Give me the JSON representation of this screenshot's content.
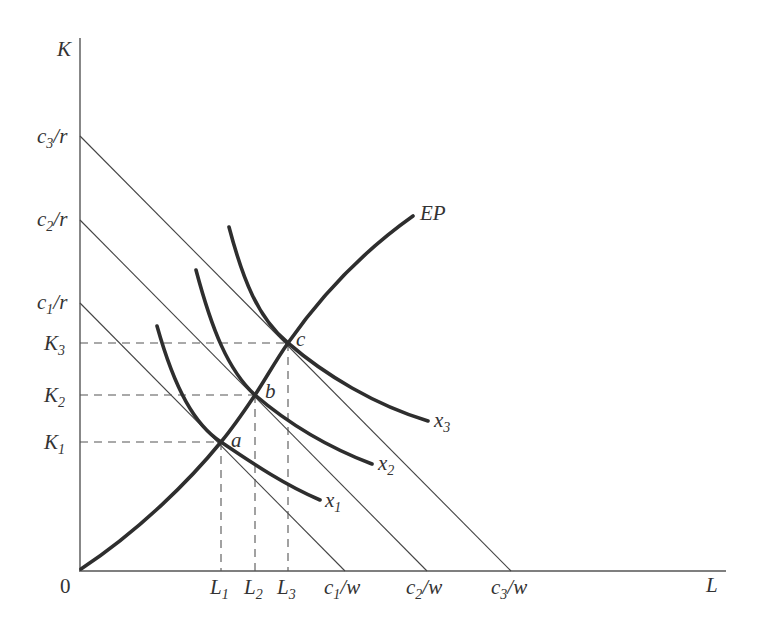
{
  "diagram": {
    "type": "isoquant-isocost-expansion-path",
    "axes": {
      "y_label": "K",
      "x_label": "L",
      "origin_label": "0"
    },
    "y_intercepts": [
      {
        "id": "c3r",
        "base": "c",
        "sub": "3",
        "tail": "/r"
      },
      {
        "id": "c2r",
        "base": "c",
        "sub": "2",
        "tail": "/r"
      },
      {
        "id": "c1r",
        "base": "c",
        "sub": "1",
        "tail": "/r"
      }
    ],
    "x_intercepts": [
      {
        "id": "c1w",
        "base": "c",
        "sub": "1",
        "tail": "/w"
      },
      {
        "id": "c2w",
        "base": "c",
        "sub": "2",
        "tail": "/w"
      },
      {
        "id": "c3w",
        "base": "c",
        "sub": "3",
        "tail": "/w"
      }
    ],
    "k_levels": [
      {
        "id": "K3",
        "base": "K",
        "sub": "3"
      },
      {
        "id": "K2",
        "base": "K",
        "sub": "2"
      },
      {
        "id": "K1",
        "base": "K",
        "sub": "1"
      }
    ],
    "l_levels": [
      {
        "id": "L1",
        "base": "L",
        "sub": "1"
      },
      {
        "id": "L2",
        "base": "L",
        "sub": "2"
      },
      {
        "id": "L3",
        "base": "L",
        "sub": "3"
      }
    ],
    "isoquants": [
      {
        "id": "x1",
        "base": "x",
        "sub": "1"
      },
      {
        "id": "x2",
        "base": "x",
        "sub": "2"
      },
      {
        "id": "x3",
        "base": "x",
        "sub": "3"
      }
    ],
    "tangency_points": [
      "a",
      "b",
      "c"
    ],
    "expansion_path_label": "EP"
  }
}
